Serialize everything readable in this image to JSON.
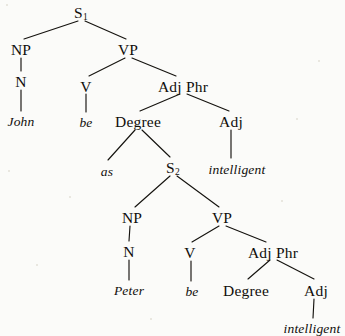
{
  "diagram": {
    "type": "constituency-tree",
    "canvas": {
      "width": 345,
      "height": 336
    },
    "ink_color": "#15130f",
    "paper_color": "#fbfbf9",
    "sentence": "John be as intelligent as Peter be intelligent",
    "nodes": [
      {
        "id": "s1",
        "label": "S",
        "sub": "1",
        "kind": "category",
        "x": 81,
        "y": 5
      },
      {
        "id": "np1",
        "label": "NP",
        "sub": "",
        "kind": "category",
        "x": 21,
        "y": 42
      },
      {
        "id": "vp1",
        "label": "VP",
        "sub": "",
        "kind": "category",
        "x": 128,
        "y": 42
      },
      {
        "id": "n1",
        "label": "N",
        "sub": "",
        "kind": "category",
        "x": 21,
        "y": 74
      },
      {
        "id": "v1",
        "label": "V",
        "sub": "",
        "kind": "category",
        "x": 86,
        "y": 79
      },
      {
        "id": "adjphr1",
        "label": "Adj Phr",
        "sub": "",
        "kind": "category",
        "x": 183,
        "y": 79
      },
      {
        "id": "john",
        "label": "John",
        "sub": "",
        "kind": "word",
        "x": 21,
        "y": 115
      },
      {
        "id": "be1",
        "label": "be",
        "sub": "",
        "kind": "word",
        "x": 86,
        "y": 116
      },
      {
        "id": "degree1",
        "label": "Degree",
        "sub": "",
        "kind": "category",
        "x": 138,
        "y": 114
      },
      {
        "id": "adj1",
        "label": "Adj",
        "sub": "",
        "kind": "category",
        "x": 231,
        "y": 114
      },
      {
        "id": "as",
        "label": "as",
        "sub": "",
        "kind": "word",
        "x": 107,
        "y": 165
      },
      {
        "id": "s2",
        "label": "S",
        "sub": "2",
        "kind": "category",
        "x": 173,
        "y": 160
      },
      {
        "id": "intell1",
        "label": "intelligent",
        "sub": "",
        "kind": "word",
        "x": 237,
        "y": 163
      },
      {
        "id": "np2",
        "label": "NP",
        "sub": "",
        "kind": "category",
        "x": 132,
        "y": 210
      },
      {
        "id": "vp2",
        "label": "VP",
        "sub": "",
        "kind": "category",
        "x": 222,
        "y": 210
      },
      {
        "id": "n2",
        "label": "N",
        "sub": "",
        "kind": "category",
        "x": 129,
        "y": 244
      },
      {
        "id": "v2",
        "label": "V",
        "sub": "",
        "kind": "category",
        "x": 190,
        "y": 245
      },
      {
        "id": "adjphr2",
        "label": "Adj Phr",
        "sub": "",
        "kind": "category",
        "x": 273,
        "y": 245
      },
      {
        "id": "peter",
        "label": "Peter",
        "sub": "",
        "kind": "word",
        "x": 129,
        "y": 284
      },
      {
        "id": "be2",
        "label": "be",
        "sub": "",
        "kind": "word",
        "x": 192,
        "y": 285
      },
      {
        "id": "degree2",
        "label": "Degree",
        "sub": "",
        "kind": "category",
        "x": 246,
        "y": 283
      },
      {
        "id": "adj2",
        "label": "Adj",
        "sub": "",
        "kind": "category",
        "x": 316,
        "y": 283
      },
      {
        "id": "intell2",
        "label": "intelligent",
        "sub": "",
        "kind": "word",
        "x": 312,
        "y": 322
      }
    ],
    "edges": [
      {
        "from": "s1",
        "to": "np1",
        "x1": 78,
        "y1": 21,
        "x2": 24,
        "y2": 39
      },
      {
        "from": "s1",
        "to": "vp1",
        "x1": 85,
        "y1": 21,
        "x2": 126,
        "y2": 39
      },
      {
        "from": "np1",
        "to": "n1",
        "x1": 21,
        "y1": 58,
        "x2": 21,
        "y2": 71
      },
      {
        "from": "n1",
        "to": "john",
        "x1": 21,
        "y1": 90,
        "x2": 21,
        "y2": 111
      },
      {
        "from": "vp1",
        "to": "v1",
        "x1": 125,
        "y1": 58,
        "x2": 89,
        "y2": 76
      },
      {
        "from": "vp1",
        "to": "adjphr1",
        "x1": 132,
        "y1": 58,
        "x2": 176,
        "y2": 76
      },
      {
        "from": "v1",
        "to": "be1",
        "x1": 86,
        "y1": 94,
        "x2": 86,
        "y2": 112
      },
      {
        "from": "adjphr1",
        "to": "degree1",
        "x1": 180,
        "y1": 94,
        "x2": 140,
        "y2": 111
      },
      {
        "from": "adjphr1",
        "to": "adj1",
        "x1": 187,
        "y1": 94,
        "x2": 229,
        "y2": 111
      },
      {
        "from": "degree1",
        "to": "as",
        "x1": 135,
        "y1": 130,
        "x2": 108,
        "y2": 160
      },
      {
        "from": "degree1",
        "to": "s2",
        "x1": 142,
        "y1": 130,
        "x2": 170,
        "y2": 157
      },
      {
        "from": "adj1",
        "to": "intell1",
        "x1": 231,
        "y1": 130,
        "x2": 231,
        "y2": 158
      },
      {
        "from": "s2",
        "to": "np2",
        "x1": 170,
        "y1": 176,
        "x2": 135,
        "y2": 207
      },
      {
        "from": "s2",
        "to": "vp2",
        "x1": 177,
        "y1": 176,
        "x2": 219,
        "y2": 207
      },
      {
        "from": "np2",
        "to": "n2",
        "x1": 130,
        "y1": 226,
        "x2": 129,
        "y2": 241
      },
      {
        "from": "n2",
        "to": "peter",
        "x1": 129,
        "y1": 260,
        "x2": 129,
        "y2": 280
      },
      {
        "from": "vp2",
        "to": "v2",
        "x1": 219,
        "y1": 226,
        "x2": 192,
        "y2": 242
      },
      {
        "from": "vp2",
        "to": "adjphr2",
        "x1": 226,
        "y1": 226,
        "x2": 266,
        "y2": 242
      },
      {
        "from": "v2",
        "to": "be2",
        "x1": 191,
        "y1": 261,
        "x2": 191,
        "y2": 281
      },
      {
        "from": "adjphr2",
        "to": "degree2",
        "x1": 270,
        "y1": 260,
        "x2": 248,
        "y2": 279
      },
      {
        "from": "adjphr2",
        "to": "adj2",
        "x1": 277,
        "y1": 260,
        "x2": 314,
        "y2": 279
      },
      {
        "from": "adj2",
        "to": "intell2",
        "x1": 314,
        "y1": 299,
        "x2": 313,
        "y2": 318
      }
    ],
    "specks": [
      {
        "x": 6,
        "y": 4,
        "s": 2
      },
      {
        "x": 296,
        "y": 118,
        "s": 2
      },
      {
        "x": 8,
        "y": 170,
        "s": 2
      },
      {
        "x": 318,
        "y": 60,
        "s": 2
      },
      {
        "x": 36,
        "y": 264,
        "s": 2
      },
      {
        "x": 281,
        "y": 200,
        "s": 2
      },
      {
        "x": 150,
        "y": 318,
        "s": 2
      },
      {
        "x": 69,
        "y": 196,
        "s": 2
      }
    ]
  }
}
